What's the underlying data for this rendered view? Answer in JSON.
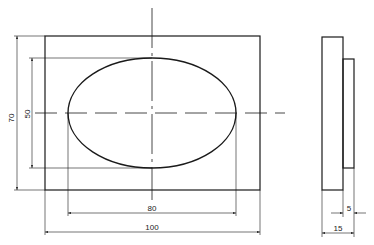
{
  "drawing": {
    "type": "engineering-orthographic-drawing",
    "views": [
      "front-view",
      "side-view"
    ],
    "line_color": "#1a1a1a",
    "background": "#ffffff"
  },
  "front_view": {
    "outer_rectangle": {
      "x": 45,
      "y": 36,
      "width": 215,
      "height": 154
    },
    "ellipse": {
      "cx": 152,
      "cy": 113,
      "rx": 84,
      "ry": 55
    },
    "centerline_vertical": {
      "x": 152,
      "y1": 8,
      "y2": 200
    },
    "centerline_horizontal": {
      "y": 113,
      "x1": 35,
      "x2": 285
    }
  },
  "side_view": {
    "body": {
      "x": 322,
      "y": 37,
      "width": 21,
      "height": 153
    },
    "boss": {
      "x": 343,
      "y": 59,
      "width": 11,
      "height": 109
    }
  },
  "dimensions": {
    "height_outer": {
      "label": "70",
      "orientation": "vertical"
    },
    "height_ellipse": {
      "label": "50",
      "orientation": "vertical"
    },
    "width_ellipse": {
      "label": "80",
      "orientation": "horizontal"
    },
    "width_outer": {
      "label": "100",
      "orientation": "horizontal"
    },
    "boss_depth": {
      "label": "5",
      "orientation": "horizontal"
    },
    "total_depth": {
      "label": "15",
      "orientation": "horizontal"
    }
  }
}
